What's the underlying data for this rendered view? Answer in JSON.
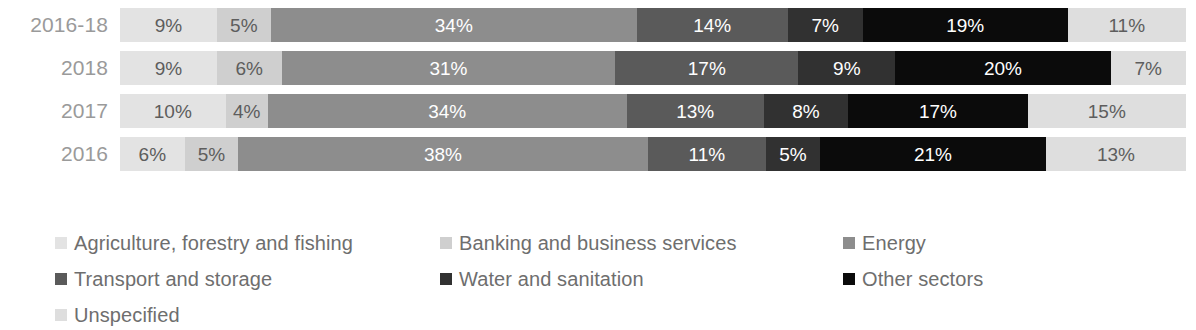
{
  "chart_data": {
    "type": "bar",
    "orientation": "horizontal",
    "stacked": true,
    "normalized_percent": true,
    "title": "",
    "subtitle": "",
    "xlabel": "",
    "ylabel": "",
    "xlim": [
      0,
      100
    ],
    "grid": false,
    "legend_position": "bottom",
    "categories": [
      "2016-18",
      "2018",
      "2017",
      "2016"
    ],
    "series": [
      {
        "name": "Agriculture, forestry and fishing",
        "color": "#e3e3e3",
        "label_style": "light",
        "values": [
          9,
          9,
          10,
          6
        ],
        "value_labels": [
          "9%",
          "9%",
          "10%",
          "6%"
        ]
      },
      {
        "name": "Banking and business services",
        "color": "#cfcfcf",
        "label_style": "light",
        "values": [
          5,
          6,
          4,
          5
        ],
        "value_labels": [
          "5%",
          "6%",
          "4%",
          "5%"
        ]
      },
      {
        "name": "Energy",
        "color": "#8d8d8d",
        "label_style": "dark",
        "values": [
          34,
          31,
          34,
          38
        ],
        "value_labels": [
          "34%",
          "31%",
          "34%",
          "38%"
        ]
      },
      {
        "name": "Transport and storage",
        "color": "#5a5a5a",
        "label_style": "dark",
        "values": [
          14,
          17,
          13,
          11
        ],
        "value_labels": [
          "14%",
          "17%",
          "13%",
          "11%"
        ]
      },
      {
        "name": "Water and sanitation",
        "color": "#313131",
        "label_style": "dark",
        "values": [
          7,
          9,
          8,
          5
        ],
        "value_labels": [
          "7%",
          "9%",
          "8%",
          "5%"
        ]
      },
      {
        "name": "Other sectors",
        "color": "#0b0b0b",
        "label_style": "dark",
        "values": [
          19,
          20,
          17,
          21
        ],
        "value_labels": [
          "19%",
          "20%",
          "17%",
          "21%"
        ]
      },
      {
        "name": "Unspecified",
        "color": "#dedede",
        "label_style": "light",
        "values": [
          11,
          7,
          15,
          13
        ],
        "value_labels": [
          "11%",
          "7%",
          "15%",
          "13%"
        ]
      }
    ]
  },
  "legend": {
    "columns": 3,
    "entries": [
      {
        "label": "Agriculture, forestry and fishing",
        "color": "#e3e3e3",
        "col": 0,
        "row": 0
      },
      {
        "label": "Banking and business services",
        "color": "#cfcfcf",
        "col": 1,
        "row": 0
      },
      {
        "label": "Energy",
        "color": "#8d8d8d",
        "col": 2,
        "row": 0
      },
      {
        "label": "Transport and storage",
        "color": "#5a5a5a",
        "col": 0,
        "row": 1
      },
      {
        "label": "Water and sanitation",
        "color": "#313131",
        "col": 1,
        "row": 1
      },
      {
        "label": "Other sectors",
        "color": "#0b0b0b",
        "col": 2,
        "row": 1
      },
      {
        "label": "Unspecified",
        "color": "#dedede",
        "col": 0,
        "row": 2
      }
    ]
  }
}
